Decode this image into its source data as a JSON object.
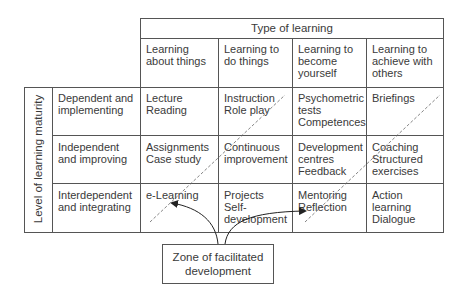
{
  "title": "Type of learning",
  "columns": [
    {
      "label": "Learning\nabout things"
    },
    {
      "label": "Learning to\ndo things"
    },
    {
      "label": "Learning to\nbecome\nyourself"
    },
    {
      "label": "Learning to\nachieve with\nothers"
    }
  ],
  "row_axis_label": "Level of learning maturity",
  "rows": [
    {
      "label": "Dependent and\nimplementing",
      "cells": [
        "Lecture\nReading",
        "Instruction\nRole play",
        "Psychometric\ntests\nCompetences",
        "Briefings"
      ]
    },
    {
      "label": "Independent\nand improving",
      "cells": [
        "Assignments\nCase study",
        "Continuous\nimprovement",
        "Development\ncentres\nFeedback",
        "Coaching\nStructured\nexercises"
      ]
    },
    {
      "label": "Interdependent\nand integrating",
      "cells": [
        "e-Learning",
        "Projects\nSelf-\ndevelopment",
        "Mentoring\nReflection",
        "Action\nlearning\nDialogue"
      ]
    }
  ],
  "zone_label": "Zone of facilitated\ndevelopment"
}
